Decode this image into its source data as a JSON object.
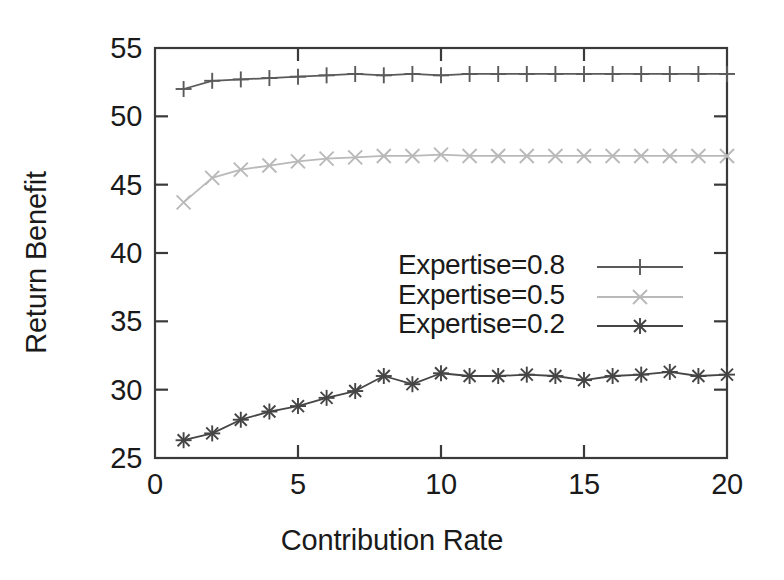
{
  "chart_data": {
    "type": "line",
    "title": "",
    "xlabel": "Contribution Rate",
    "ylabel": "Return Benefit",
    "xlim": [
      0,
      20
    ],
    "ylim": [
      25,
      55
    ],
    "xticks": [
      "0",
      "5",
      "10",
      "15",
      "20"
    ],
    "xtick_values": [
      0,
      5,
      10,
      15,
      20
    ],
    "yticks": [
      "25",
      "30",
      "35",
      "40",
      "45",
      "50",
      "55"
    ],
    "ytick_values": [
      25,
      30,
      35,
      40,
      45,
      50,
      55
    ],
    "grid": false,
    "legend_position": "center",
    "x": [
      1,
      2,
      3,
      4,
      5,
      6,
      7,
      8,
      9,
      10,
      11,
      12,
      13,
      14,
      15,
      16,
      17,
      18,
      19,
      20
    ],
    "series": [
      {
        "name": "Expertise=0.8",
        "marker": "plus",
        "color": "#5a5a5a",
        "values": [
          52.0,
          52.6,
          52.7,
          52.8,
          52.9,
          53.0,
          53.1,
          53.0,
          53.1,
          53.0,
          53.1,
          53.1,
          53.1,
          53.1,
          53.1,
          53.1,
          53.1,
          53.1,
          53.1,
          53.1
        ]
      },
      {
        "name": "Expertise=0.5",
        "marker": "cross",
        "color": "#b9b9b9",
        "values": [
          43.7,
          45.5,
          46.1,
          46.4,
          46.7,
          46.9,
          47.0,
          47.1,
          47.1,
          47.2,
          47.1,
          47.1,
          47.1,
          47.1,
          47.1,
          47.1,
          47.1,
          47.1,
          47.1,
          47.1
        ]
      },
      {
        "name": "Expertise=0.2",
        "marker": "star",
        "color": "#454545",
        "values": [
          26.3,
          26.8,
          27.8,
          28.4,
          28.8,
          29.4,
          29.9,
          31.0,
          30.4,
          31.2,
          31.0,
          31.0,
          31.1,
          31.0,
          30.7,
          31.0,
          31.1,
          31.3,
          31.0,
          31.1
        ]
      }
    ]
  },
  "legend": {
    "entries": [
      {
        "label": "Expertise=0.8"
      },
      {
        "label": "Expertise=0.5"
      },
      {
        "label": "Expertise=0.2"
      }
    ]
  },
  "axes": {
    "frame_color": "#3a3a3a"
  }
}
